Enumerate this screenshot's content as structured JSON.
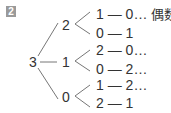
{
  "problem_number": "2",
  "tree": {
    "root": "3",
    "level1": [
      "2",
      "1",
      "0"
    ],
    "rows": [
      {
        "a": "1",
        "b": "0",
        "dots": "…",
        "note": "偶数"
      },
      {
        "a": "0",
        "b": "1",
        "dots": "",
        "note": ""
      },
      {
        "a": "2",
        "b": "0",
        "dots": "…",
        "note": ""
      },
      {
        "a": "0",
        "b": "2",
        "dots": "…",
        "note": ""
      },
      {
        "a": "1",
        "b": "2",
        "dots": "…",
        "note": ""
      },
      {
        "a": "2",
        "b": "1",
        "dots": "",
        "note": ""
      }
    ],
    "dash": "—"
  }
}
